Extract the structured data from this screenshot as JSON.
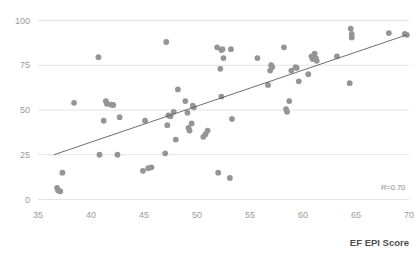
{
  "chart_data": {
    "type": "scatter",
    "title": "",
    "subtitle": "",
    "xlabel": "EF EPI Score",
    "ylabel": "",
    "xlim": [
      35,
      70
    ],
    "ylim": [
      0,
      100
    ],
    "xticks": [
      35,
      40,
      45,
      50,
      55,
      60,
      65,
      70
    ],
    "yticks": [
      0,
      25,
      50,
      75,
      100
    ],
    "xtick_labels": [
      "35",
      "40",
      "45",
      "50",
      "55",
      "60",
      "65",
      "70"
    ],
    "ytick_labels": [
      "0",
      "25",
      "50",
      "75",
      "100"
    ],
    "grid": "horizontal",
    "legend": "none",
    "marker_color": "#959595",
    "gridline_color": "#e3e3e3",
    "trendline_color": "#5e5e5e",
    "annotations": [
      {
        "name": "correlation",
        "text": "R=0.70",
        "x": 68.5,
        "y": 5.5
      }
    ],
    "trendline": {
      "type": "linear",
      "x_start": 36.5,
      "y_start": 25.0,
      "x_end": 69.8,
      "y_end": 92.0
    },
    "points": [
      [
        36.8,
        6.5
      ],
      [
        36.9,
        5.0
      ],
      [
        37.1,
        4.6
      ],
      [
        37.3,
        15.0
      ],
      [
        38.4,
        54.0
      ],
      [
        40.7,
        79.5
      ],
      [
        40.8,
        25.0
      ],
      [
        41.2,
        44.0
      ],
      [
        41.4,
        55.0
      ],
      [
        41.5,
        53.5
      ],
      [
        41.9,
        53.0
      ],
      [
        42.1,
        52.8
      ],
      [
        42.5,
        25.0
      ],
      [
        42.7,
        46.0
      ],
      [
        44.9,
        16.0
      ],
      [
        45.1,
        44.0
      ],
      [
        45.4,
        17.5
      ],
      [
        45.7,
        18.0
      ],
      [
        47.0,
        25.8
      ],
      [
        47.1,
        88.0
      ],
      [
        47.2,
        41.5
      ],
      [
        47.3,
        47.0
      ],
      [
        47.5,
        46.5
      ],
      [
        47.8,
        49.0
      ],
      [
        48.0,
        33.5
      ],
      [
        48.2,
        61.5
      ],
      [
        48.9,
        55.0
      ],
      [
        49.1,
        48.5
      ],
      [
        49.2,
        40.0
      ],
      [
        49.3,
        38.5
      ],
      [
        49.5,
        42.5
      ],
      [
        49.6,
        52.5
      ],
      [
        49.7,
        51.5
      ],
      [
        50.6,
        35.0
      ],
      [
        50.8,
        36.5
      ],
      [
        51.0,
        38.5
      ],
      [
        51.9,
        85.0
      ],
      [
        52.0,
        15.0
      ],
      [
        52.2,
        73.0
      ],
      [
        52.3,
        83.5
      ],
      [
        52.4,
        84.0
      ],
      [
        52.5,
        79.0
      ],
      [
        52.3,
        57.5
      ],
      [
        53.1,
        12.0
      ],
      [
        53.2,
        84.0
      ],
      [
        53.3,
        45.0
      ],
      [
        55.7,
        79.0
      ],
      [
        56.7,
        64.0
      ],
      [
        56.9,
        72.0
      ],
      [
        57.0,
        75.0
      ],
      [
        57.1,
        74.0
      ],
      [
        58.2,
        85.0
      ],
      [
        58.4,
        50.5
      ],
      [
        58.5,
        49.0
      ],
      [
        58.7,
        55.0
      ],
      [
        58.9,
        72.0
      ],
      [
        59.3,
        74.0
      ],
      [
        59.4,
        73.5
      ],
      [
        59.6,
        66.0
      ],
      [
        60.5,
        70.0
      ],
      [
        60.8,
        80.0
      ],
      [
        60.9,
        78.5
      ],
      [
        61.1,
        81.5
      ],
      [
        61.2,
        79.0
      ],
      [
        61.3,
        77.5
      ],
      [
        63.2,
        80.0
      ],
      [
        64.4,
        65.0
      ],
      [
        64.5,
        95.5
      ],
      [
        64.6,
        92.5
      ],
      [
        64.6,
        90.5
      ],
      [
        68.1,
        93.0
      ],
      [
        69.6,
        92.5
      ],
      [
        69.8,
        92.0
      ]
    ]
  }
}
